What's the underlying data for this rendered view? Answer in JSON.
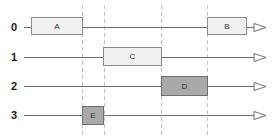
{
  "diagram": {
    "type": "timeline-gantt",
    "colors": {
      "line": "#6e6e6e",
      "dashed_guide": "#c4c4c4",
      "light_box_fill": "#f1f1f1",
      "dark_box_fill": "#a9a9a9",
      "box_border": "#8a8a8a",
      "arrow_fill": "#ffffff"
    },
    "guides_x": [
      82,
      104,
      161,
      207
    ],
    "rows": [
      {
        "label": "0",
        "y": 27
      },
      {
        "label": "1",
        "y": 57
      },
      {
        "label": "2",
        "y": 86
      },
      {
        "label": "3",
        "y": 115
      }
    ],
    "tasks": [
      {
        "label": "A",
        "row": 0,
        "x1": 31,
        "x2": 83,
        "shade": "light"
      },
      {
        "label": "B",
        "row": 0,
        "x1": 207,
        "x2": 247,
        "shade": "light"
      },
      {
        "label": "C",
        "row": 1,
        "x1": 103,
        "x2": 162,
        "shade": "light"
      },
      {
        "label": "D",
        "row": 2,
        "x1": 161,
        "x2": 208,
        "shade": "dark"
      },
      {
        "label": "E",
        "row": 3,
        "x1": 82,
        "x2": 104,
        "shade": "dark"
      }
    ]
  }
}
